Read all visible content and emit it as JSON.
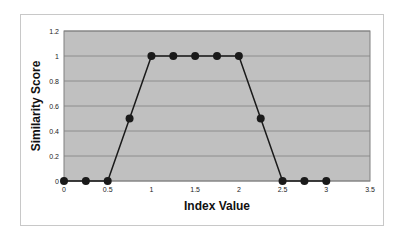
{
  "chart_data": {
    "type": "line",
    "title": "",
    "xlabel": "Index Value",
    "ylabel": "Similarity Score",
    "xlim": [
      0,
      3.5
    ],
    "ylim": [
      0,
      1.2
    ],
    "x_ticks": [
      "0",
      "0.5",
      "1",
      "1.5",
      "2",
      "2.5",
      "3",
      "3.5"
    ],
    "y_ticks": [
      "0",
      "0.2",
      "0.4",
      "0.6",
      "0.8",
      "1",
      "1.2"
    ],
    "grid": true,
    "legend": null,
    "series": [
      {
        "name": "Similarity Score",
        "x": [
          0,
          0.25,
          0.5,
          0.75,
          1,
          1.25,
          1.5,
          1.75,
          2,
          2.25,
          2.5,
          2.75,
          3
        ],
        "values": [
          0,
          0,
          0,
          0.5,
          1,
          1,
          1,
          1,
          1,
          0.5,
          0,
          0,
          0
        ]
      }
    ]
  },
  "colors": {
    "plot_background": "#c0c0c0",
    "gridline": "#808080",
    "line": "#1a1a1a",
    "marker": "#1a1a1a"
  }
}
